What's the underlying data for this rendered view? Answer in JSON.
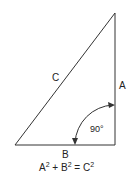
{
  "diagram": {
    "labels": {
      "hypotenuse": "C",
      "vertical_side": "A",
      "base": "B",
      "angle": "90°"
    },
    "equation": {
      "a": "A",
      "b": "B",
      "c": "C",
      "exp": "2",
      "plus": "+",
      "equals": "="
    },
    "colors": {
      "line": "#333333",
      "background": "#ffffff"
    }
  }
}
